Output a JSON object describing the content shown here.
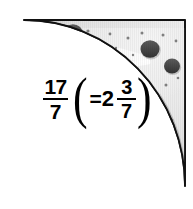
{
  "illustration": {
    "title": "quarter-pizza-fraction-diagram",
    "shape": "quarter-circle-pizza-slice",
    "alt_label": "Quarter of a pizza shown in grayscale with pepperoni toppings",
    "colors": {
      "outline": "#111111",
      "crust_dark": "#9d9d9d",
      "crust_light": "#c9c9c9",
      "cheese_base": "#e3e3e3",
      "cheese_highlight": "#fbfbfb",
      "pepperoni_dark": "#4a4a4a",
      "pepperoni_mid": "#6f6f6f",
      "speck": "#7a7a7a",
      "background": "#ffffff",
      "text": "#000000"
    },
    "geometry": {
      "center_x": 185,
      "center_y": 20,
      "radius_x": 161,
      "radius_y": 166,
      "top_left_x": 24,
      "top_left_y": 20,
      "bottom_right_x": 185,
      "bottom_right_y": 186
    },
    "pepperoni": [
      {
        "cx": 73,
        "cy": 33,
        "r": 9.5,
        "tone": "pepperoni_dark"
      },
      {
        "cx": 61,
        "cy": 52,
        "r": 10.5,
        "tone": "pepperoni_mid"
      },
      {
        "cx": 150,
        "cy": 49,
        "r": 9.5,
        "tone": "pepperoni_dark"
      },
      {
        "cx": 172,
        "cy": 66,
        "r": 8.0,
        "tone": "pepperoni_dark"
      },
      {
        "cx": 77,
        "cy": 106,
        "r": 7.5,
        "tone": "pepperoni_mid"
      },
      {
        "cx": 166,
        "cy": 149,
        "r": 8.5,
        "tone": "pepperoni_dark"
      }
    ],
    "specks": [
      {
        "cx": 62,
        "cy": 32,
        "r": 1.3
      },
      {
        "cx": 88,
        "cy": 31,
        "r": 1.6
      },
      {
        "cx": 110,
        "cy": 34,
        "r": 1.4
      },
      {
        "cx": 128,
        "cy": 38,
        "r": 1.5
      },
      {
        "cx": 142,
        "cy": 33,
        "r": 1.5
      },
      {
        "cx": 163,
        "cy": 35,
        "r": 1.5
      },
      {
        "cx": 176,
        "cy": 41,
        "r": 1.4
      },
      {
        "cx": 52,
        "cy": 43,
        "r": 1.6
      },
      {
        "cx": 100,
        "cy": 44,
        "r": 1.2
      },
      {
        "cx": 116,
        "cy": 48,
        "r": 1.2
      },
      {
        "cx": 48,
        "cy": 61,
        "r": 1.4
      },
      {
        "cx": 90,
        "cy": 53,
        "r": 1.2
      },
      {
        "cx": 107,
        "cy": 55,
        "r": 1.3
      },
      {
        "cx": 133,
        "cy": 55,
        "r": 1.2
      },
      {
        "cx": 62,
        "cy": 70,
        "r": 1.5
      },
      {
        "cx": 55,
        "cy": 80,
        "r": 1.3
      },
      {
        "cx": 166,
        "cy": 85,
        "r": 1.5
      },
      {
        "cx": 178,
        "cy": 78,
        "r": 1.3
      },
      {
        "cx": 60,
        "cy": 95,
        "r": 1.2
      },
      {
        "cx": 97,
        "cy": 109,
        "r": 1.3
      },
      {
        "cx": 151,
        "cy": 110,
        "r": 1.4
      },
      {
        "cx": 160,
        "cy": 118,
        "r": 1.3
      },
      {
        "cx": 147,
        "cy": 122,
        "r": 1.5
      },
      {
        "cx": 108,
        "cy": 123,
        "r": 1.5
      },
      {
        "cx": 132,
        "cy": 133,
        "r": 1.5
      },
      {
        "cx": 145,
        "cy": 140,
        "r": 1.4
      },
      {
        "cx": 118,
        "cy": 142,
        "r": 1.3
      },
      {
        "cx": 95,
        "cy": 131,
        "r": 1.4
      },
      {
        "cx": 152,
        "cy": 160,
        "r": 1.3
      },
      {
        "cx": 136,
        "cy": 155,
        "r": 1.2
      },
      {
        "cx": 172,
        "cy": 120,
        "r": 1.3
      }
    ]
  },
  "expression": {
    "improper_fraction": {
      "numerator": "17",
      "denominator": "7"
    },
    "open_paren": "(",
    "equals": "=",
    "whole_number": "2",
    "proper_fraction": {
      "numerator": "3",
      "denominator": "7"
    },
    "close_paren": ")",
    "plain_text": "17/7 (= 2 3/7)"
  }
}
